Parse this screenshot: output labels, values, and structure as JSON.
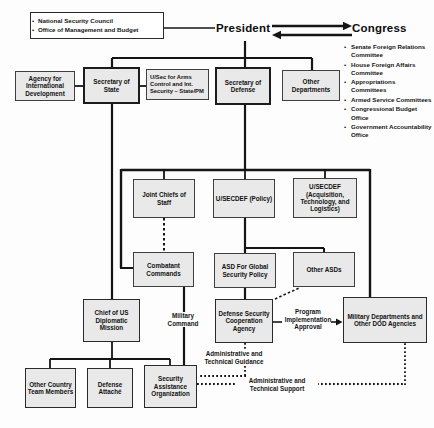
{
  "colors": {
    "bg": "#fdfdfd",
    "box_fill": "#e9e9e9",
    "box_border": "#3f3f3f",
    "line": "#151515"
  },
  "top": {
    "nsc_omb": {
      "items": [
        "National Security Council",
        "Office of Management and Budget"
      ]
    },
    "president": "President",
    "congress": {
      "title": "Congress",
      "items": [
        "Senate Foreign Relations Committee",
        "House Foreign Affairs Committee",
        "Appropriations Committees",
        "Armed Service Committees",
        "Congressional Budget Office",
        "Government Accountability Office"
      ]
    }
  },
  "boxes": {
    "aid": "Agency for International Development",
    "sec_state": "Secretary of State",
    "usec_arms": "U/Sec for Arms Control and Int. Security – State/PM",
    "sec_def": "Secretary of Defense",
    "other_departments": "Other Departments",
    "joint_chiefs": "Joint Chiefs of Staff",
    "usecdef_policy": "U/SECDEF (Policy)",
    "usecdef_atl": "U/SECDEF (Acquisition, Technology, and Logistics)",
    "combatant_commands": "Combatant Commands",
    "asd_global": "ASD For Global Security Policy",
    "other_asds": "Other ASDs",
    "chief_mission": "Chief of US Diplomatic Mission",
    "dsca": "Defense Security Cooperation Agency",
    "mil_departments": "Military Departments and Other DOD Agencies",
    "other_country": "Other Country Team Members",
    "defense_attache": "Defense Attaché",
    "sao": "Security Assistance Organization"
  },
  "labels": {
    "military_command": "Military Command",
    "program_implementation": "Program Implementation Approval",
    "admin_guidance": "Administrative and Technical Guidance",
    "admin_support": "Administrative and Technical Support"
  }
}
